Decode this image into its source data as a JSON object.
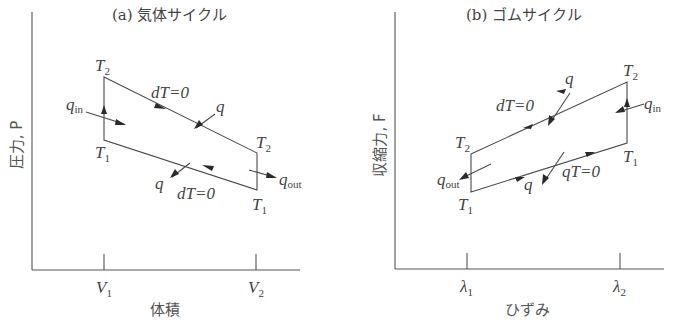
{
  "panel_a": {
    "title": "(a) 気体サイクル",
    "y_axis_label": "圧力, P",
    "x_axis_label": "体積",
    "x_ticks": [
      {
        "label": "V",
        "sub": "1"
      },
      {
        "label": "V",
        "sub": "2"
      }
    ],
    "corners": {
      "top_left": {
        "T": "T",
        "sub": "2"
      },
      "bottom_left": {
        "T": "T",
        "sub": "1"
      },
      "top_right": {
        "T": "T",
        "sub": "2"
      },
      "bottom_right": {
        "T": "T",
        "sub": "1"
      }
    },
    "labels": {
      "isotherm_top": "dT=0",
      "isotherm_bottom": "dT=0",
      "q_top": "q",
      "q_bottom": "q",
      "q_in": "q",
      "q_in_sub": "in",
      "q_out": "q",
      "q_out_sub": "out"
    }
  },
  "panel_b": {
    "title": "(b) ゴムサイクル",
    "y_axis_label": "収縮力, F",
    "x_axis_label": "ひずみ",
    "x_ticks": [
      {
        "label": "λ",
        "sub": "1"
      },
      {
        "label": "λ",
        "sub": "2"
      }
    ],
    "corners": {
      "top_left": {
        "T": "T",
        "sub": "2"
      },
      "bottom_left": {
        "T": "T",
        "sub": "1"
      },
      "top_right": {
        "T": "T",
        "sub": "2"
      },
      "bottom_right": {
        "T": "T",
        "sub": "1"
      }
    },
    "labels": {
      "isotherm_top": "dT=0",
      "isotherm_bottom": "qT=0",
      "q_top": "q",
      "q_bottom": "q",
      "q_in": "q",
      "q_in_sub": "in",
      "q_out": "q",
      "q_out_sub": "out"
    }
  }
}
